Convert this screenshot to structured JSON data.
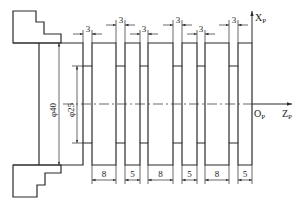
{
  "diagram": {
    "type": "turning-part-drawing",
    "axes": {
      "x_label": "X",
      "x_sub": "P",
      "z_label": "Z",
      "z_sub": "P",
      "origin_label": "O",
      "origin_sub": "P"
    },
    "diameters": {
      "outer": "φ40",
      "inner": "φ25"
    },
    "groove_widths": [
      "3",
      "3",
      "3",
      "3",
      "3",
      "3"
    ],
    "segment_widths": [
      "8",
      "5",
      "8",
      "5",
      "8",
      "5"
    ],
    "colors": {
      "line": "#2a2a2a",
      "background": "#ffffff"
    }
  }
}
